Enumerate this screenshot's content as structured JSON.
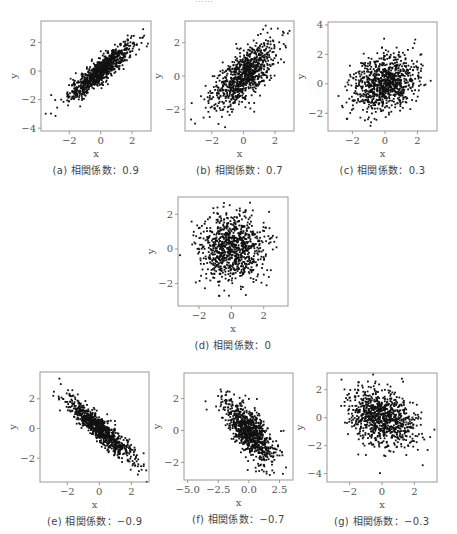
{
  "header_fragment": "……",
  "footer_fragment": "……",
  "chart_data": [
    {
      "id": "a",
      "type": "scatter",
      "caption": "(a) 相関係数：0.9",
      "xlabel": "x",
      "ylabel": "y",
      "correlation": 0.9,
      "n_points_approx": 1000,
      "xlim": [
        -3.8,
        3.2
      ],
      "ylim": [
        -4.2,
        3.5
      ],
      "xticks": [
        -2,
        0,
        2
      ],
      "yticks": [
        -4,
        -2,
        0,
        2
      ],
      "grid": false,
      "frame": {
        "left": 41,
        "top": 21,
        "right": 151,
        "bottom": 131
      }
    },
    {
      "id": "b",
      "type": "scatter",
      "caption": "(b) 相関係数：0.7",
      "xlabel": "x",
      "ylabel": "y",
      "correlation": 0.7,
      "n_points_approx": 1000,
      "xlim": [
        -3.7,
        3.2
      ],
      "ylim": [
        -3.3,
        3.3
      ],
      "xticks": [
        -2,
        0,
        2
      ],
      "yticks": [
        -2,
        0,
        2
      ],
      "grid": false,
      "frame": {
        "left": 185,
        "top": 21,
        "right": 294,
        "bottom": 131
      }
    },
    {
      "id": "c",
      "type": "scatter",
      "caption": "(c) 相関係数：0.3",
      "xlabel": "x",
      "ylabel": "y",
      "correlation": 0.3,
      "n_points_approx": 1000,
      "xlim": [
        -3.5,
        3.2
      ],
      "ylim": [
        -3.2,
        4.2
      ],
      "xticks": [
        -2,
        0,
        2
      ],
      "yticks": [
        -2,
        0,
        2,
        4
      ],
      "grid": false,
      "frame": {
        "left": 328,
        "top": 22,
        "right": 437,
        "bottom": 131
      }
    },
    {
      "id": "d",
      "type": "scatter",
      "caption": "(d) 相関係数：0",
      "xlabel": "x",
      "ylabel": "y",
      "correlation": 0,
      "n_points_approx": 1000,
      "xlim": [
        -3.3,
        3.5
      ],
      "ylim": [
        -3.3,
        3.0
      ],
      "xticks": [
        -2,
        0,
        2
      ],
      "yticks": [
        -2,
        0,
        2
      ],
      "grid": false,
      "frame": {
        "left": 178,
        "top": 197,
        "right": 288,
        "bottom": 306
      }
    },
    {
      "id": "e",
      "type": "scatter",
      "caption": "(e) 相関係数：−0.9",
      "xlabel": "x",
      "ylabel": "y",
      "correlation": -0.9,
      "n_points_approx": 1000,
      "xlim": [
        -3.7,
        3.1
      ],
      "ylim": [
        -3.6,
        3.8
      ],
      "xticks": [
        -2,
        0,
        2
      ],
      "yticks": [
        -2,
        0,
        2
      ],
      "grid": false,
      "frame": {
        "left": 40,
        "top": 372,
        "right": 149,
        "bottom": 482
      }
    },
    {
      "id": "f",
      "type": "scatter",
      "caption": "(f) 相関係数：−0.7",
      "xlabel": "x",
      "ylabel": "y",
      "correlation": -0.7,
      "n_points_approx": 1000,
      "xlim": [
        -5.3,
        3.6
      ],
      "ylim": [
        -3.1,
        3.6
      ],
      "xticks": [
        -5.0,
        -2.5,
        0.0,
        2.5
      ],
      "xtick_labels": [
        "−5.0",
        "−2.5",
        "0.0",
        "2.5"
      ],
      "yticks": [
        -2,
        0,
        2
      ],
      "grid": false,
      "frame": {
        "left": 184,
        "top": 373,
        "right": 293,
        "bottom": 480
      }
    },
    {
      "id": "g",
      "type": "scatter",
      "caption": "(g) 相関係数：−0.3",
      "xlabel": "x",
      "ylabel": "y",
      "correlation": -0.3,
      "n_points_approx": 1000,
      "xlim": [
        -3.4,
        3.4
      ],
      "ylim": [
        -4.6,
        3.2
      ],
      "xticks": [
        -2,
        0,
        2
      ],
      "yticks": [
        -4,
        -2,
        0,
        2
      ],
      "grid": false,
      "frame": {
        "left": 327,
        "top": 373,
        "right": 437,
        "bottom": 482
      }
    }
  ],
  "colors": {
    "points": "#111111",
    "frame": "#999999",
    "text": "#444444"
  }
}
